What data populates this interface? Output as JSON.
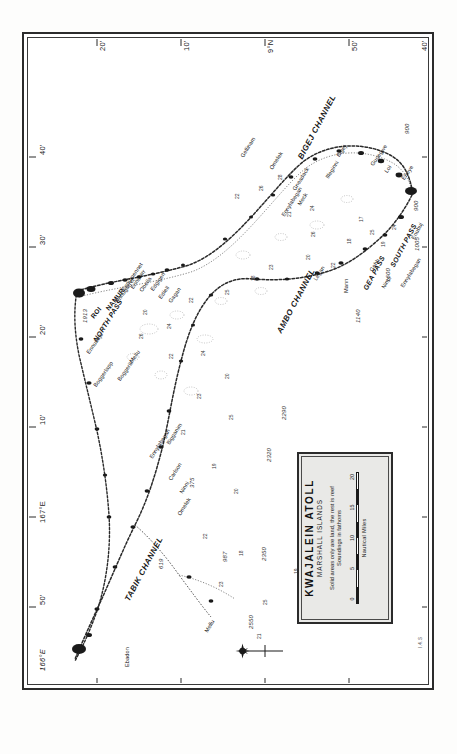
{
  "document": {
    "kind": "nautical-chart",
    "orientation": "map rotated 90 degrees counter-clockwise on portrait page"
  },
  "cartouche": {
    "title": "KWAJALEIN  ATOLL",
    "subtitle": "MARSHALL  ISLANDS",
    "note_land": "Solid areas only are land, the rest is reef",
    "note_soundings": "Soundings in fathoms",
    "scale_caption": "Nautical Miles",
    "scale_ticks": [
      "0",
      "5",
      "10",
      "15",
      "20"
    ]
  },
  "credit": "I.4.S",
  "graticule": {
    "latitude_label_edge": "top",
    "latitude_ticks": [
      "20'",
      "10'",
      "9°N",
      "50'",
      "40'"
    ],
    "longitude_label_edge": "left",
    "longitude_ticks": [
      "50'",
      "167°E",
      "10'",
      "20'",
      "30'",
      "40'"
    ],
    "corner_left_bottom": "166°E",
    "corner_left_top": "40'",
    "corner_right_top": "40'"
  },
  "channels": [
    {
      "label": "BIGEJ CHANNEL",
      "x": 268,
      "y": 118,
      "rot": -62
    },
    {
      "label": "AMBO CHANNEL",
      "x": 247,
      "y": 292,
      "rot": -62
    },
    {
      "label": "TABIK CHANNEL",
      "x": 95,
      "y": 560,
      "rot": -62
    }
  ],
  "passes": [
    {
      "label": "NORTH PASS",
      "x": 63,
      "y": 300,
      "rot": -58
    },
    {
      "label": "GEA PASS",
      "x": 333,
      "y": 249,
      "rot": -62
    },
    {
      "label": "SOUTH PASS",
      "x": 360,
      "y": 226,
      "rot": -62
    }
  ],
  "major_islands": [
    {
      "label": "KWAJALEIN ISLAND",
      "x": 399,
      "y": 137,
      "rot": -90,
      "size": "big"
    },
    {
      "label": "ROI",
      "x": 61,
      "y": 277,
      "rot": -52,
      "size": "med"
    },
    {
      "label": "NAMUR",
      "x": 76,
      "y": 269,
      "rot": -52,
      "size": "med"
    }
  ],
  "islands": [
    {
      "label": "Ebeye",
      "x": 372,
      "y": 139,
      "rot": -55
    },
    {
      "label": "Gugegwe",
      "x": 341,
      "y": 125,
      "rot": -55
    },
    {
      "label": "Bigej",
      "x": 307,
      "y": 116,
      "rot": -55
    },
    {
      "label": "Loi",
      "x": 355,
      "y": 132,
      "rot": -55
    },
    {
      "label": "Enubuj",
      "x": 382,
      "y": 199,
      "rot": -62
    },
    {
      "label": "Gellinam",
      "x": 211,
      "y": 117,
      "rot": -58
    },
    {
      "label": "Omelek",
      "x": 240,
      "y": 129,
      "rot": -58
    },
    {
      "label": "Gneadack",
      "x": 263,
      "y": 150,
      "rot": -58
    },
    {
      "label": "Meck",
      "x": 268,
      "y": 165,
      "rot": -58
    },
    {
      "label": "Ennylabegan",
      "x": 252,
      "y": 176,
      "rot": -58
    },
    {
      "label": "Illeginni",
      "x": 296,
      "y": 138,
      "rot": -58
    },
    {
      "label": "Legan",
      "x": 284,
      "y": 240,
      "rot": -58
    },
    {
      "label": "Mann",
      "x": 315,
      "y": 254,
      "rot": -90
    },
    {
      "label": "Gehh",
      "x": 340,
      "y": 231,
      "rot": -58
    },
    {
      "label": "Ninni",
      "x": 352,
      "y": 248,
      "rot": -58
    },
    {
      "label": "Ennylabegan",
      "x": 371,
      "y": 247,
      "rot": -58
    },
    {
      "label": "Ennumennet",
      "x": 92,
      "y": 250,
      "rot": -55
    },
    {
      "label": "Ennugarret",
      "x": 86,
      "y": 262,
      "rot": -55
    },
    {
      "label": "Ennubirr",
      "x": 101,
      "y": 248,
      "rot": -55
    },
    {
      "label": "Obella",
      "x": 110,
      "y": 251,
      "rot": -55
    },
    {
      "label": "Edgigen",
      "x": 121,
      "y": 250,
      "rot": -55
    },
    {
      "label": "Ediell",
      "x": 129,
      "y": 258,
      "rot": -55
    },
    {
      "label": "Gagan",
      "x": 139,
      "y": 262,
      "rot": -55
    },
    {
      "label": "Ennubujo",
      "x": 57,
      "y": 313,
      "rot": -55
    },
    {
      "label": "Mellu",
      "x": 100,
      "y": 322,
      "rot": -55
    },
    {
      "label": "Boggerik",
      "x": 88,
      "y": 340,
      "rot": -55
    },
    {
      "label": "Boggerlapp",
      "x": 64,
      "y": 346,
      "rot": -55
    },
    {
      "label": "Bigganim",
      "x": 137,
      "y": 404,
      "rot": -58
    },
    {
      "label": "Ennylabegan",
      "x": 120,
      "y": 418,
      "rot": -58
    },
    {
      "label": "Carlson",
      "x": 139,
      "y": 440,
      "rot": -58
    },
    {
      "label": "Ninni",
      "x": 150,
      "y": 453,
      "rot": -58
    },
    {
      "label": "Omelek",
      "x": 148,
      "y": 475,
      "rot": -58
    },
    {
      "label": "Mellu",
      "x": 175,
      "y": 592,
      "rot": -58
    },
    {
      "label": "Ebadon",
      "x": 96,
      "y": 628,
      "rot": -90
    }
  ],
  "soundings": [
    {
      "v": "22",
      "x": 206,
      "y": 160
    },
    {
      "v": "26",
      "x": 230,
      "y": 152
    },
    {
      "v": "28",
      "x": 249,
      "y": 141
    },
    {
      "v": "21",
      "x": 258,
      "y": 178
    },
    {
      "v": "24",
      "x": 281,
      "y": 172
    },
    {
      "v": "26",
      "x": 282,
      "y": 198
    },
    {
      "v": "17",
      "x": 330,
      "y": 183
    },
    {
      "v": "25",
      "x": 341,
      "y": 196
    },
    {
      "v": "19",
      "x": 352,
      "y": 208
    },
    {
      "v": "24",
      "x": 363,
      "y": 191
    },
    {
      "v": "18",
      "x": 318,
      "y": 205
    },
    {
      "v": "22",
      "x": 302,
      "y": 229
    },
    {
      "v": "20",
      "x": 277,
      "y": 221
    },
    {
      "v": "23",
      "x": 240,
      "y": 231
    },
    {
      "v": "18",
      "x": 222,
      "y": 242
    },
    {
      "v": "25",
      "x": 196,
      "y": 256
    },
    {
      "v": "22",
      "x": 160,
      "y": 264
    },
    {
      "v": "24",
      "x": 138,
      "y": 290
    },
    {
      "v": "20",
      "x": 114,
      "y": 276
    },
    {
      "v": "26",
      "x": 110,
      "y": 300
    },
    {
      "v": "22",
      "x": 140,
      "y": 320
    },
    {
      "v": "24",
      "x": 172,
      "y": 317
    },
    {
      "v": "20",
      "x": 196,
      "y": 340
    },
    {
      "v": "23",
      "x": 168,
      "y": 360
    },
    {
      "v": "25",
      "x": 200,
      "y": 381
    },
    {
      "v": "21",
      "x": 152,
      "y": 396
    },
    {
      "v": "19",
      "x": 183,
      "y": 430
    },
    {
      "v": "20",
      "x": 205,
      "y": 455
    },
    {
      "v": "22",
      "x": 174,
      "y": 500
    },
    {
      "v": "18",
      "x": 210,
      "y": 517
    },
    {
      "v": "23",
      "x": 190,
      "y": 548
    },
    {
      "v": "25",
      "x": 234,
      "y": 566
    },
    {
      "v": "21",
      "x": 228,
      "y": 600
    },
    {
      "v": "19",
      "x": 265,
      "y": 535
    }
  ],
  "deep_soundings": [
    {
      "v": "900",
      "x": 375,
      "y": 95
    },
    {
      "v": "1540",
      "x": 404,
      "y": 107
    },
    {
      "v": "1080",
      "x": 399,
      "y": 164
    },
    {
      "v": "900",
      "x": 384,
      "y": 172
    },
    {
      "v": "1005",
      "x": 385,
      "y": 212
    },
    {
      "v": "1600",
      "x": 356,
      "y": 243
    },
    {
      "v": "1140",
      "x": 326,
      "y": 284
    },
    {
      "v": "2290",
      "x": 252,
      "y": 381
    },
    {
      "v": "2320",
      "x": 237,
      "y": 423
    },
    {
      "v": "2350",
      "x": 232,
      "y": 522
    },
    {
      "v": "2550",
      "x": 219,
      "y": 590
    },
    {
      "v": "2900",
      "x": 167,
      "y": 661
    },
    {
      "v": "987",
      "x": 193,
      "y": 523
    },
    {
      "v": "619",
      "x": 129,
      "y": 530
    },
    {
      "v": "1913",
      "x": 53,
      "y": 284
    },
    {
      "v": "375",
      "x": 160,
      "y": 449
    }
  ],
  "compass": {
    "name": "compass-rose",
    "north_direction": "left"
  }
}
